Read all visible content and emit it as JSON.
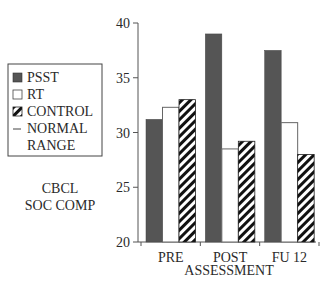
{
  "chart_data": {
    "type": "bar",
    "title": "",
    "ylabel": "CBCL SOC COMP",
    "ylabel_lines": [
      "CBCL",
      "SOC COMP"
    ],
    "xlabel": "ASSESSMENT",
    "categories": [
      "PRE",
      "POST",
      "FU 12"
    ],
    "ylim": [
      20,
      40
    ],
    "yticks": [
      20,
      25,
      30,
      35,
      40
    ],
    "grid": false,
    "legend_position": "left",
    "series": [
      {
        "name": "PSST",
        "style": "solid",
        "color": "#555555",
        "values": [
          31.2,
          39.0,
          37.5
        ]
      },
      {
        "name": "RT",
        "style": "open",
        "color": "#ffffff",
        "values": [
          32.3,
          28.5,
          30.9
        ]
      },
      {
        "name": "CONTROL",
        "style": "hatched",
        "color": "#111111",
        "values": [
          33.0,
          29.2,
          28.0
        ]
      }
    ],
    "legend": [
      {
        "label": "PSST",
        "marker": "solid-square"
      },
      {
        "label": "RT",
        "marker": "open-square"
      },
      {
        "label": "CONTROL",
        "marker": "hatched-square"
      },
      {
        "label": "NORMAL",
        "marker": "dash"
      },
      {
        "label": "RANGE",
        "marker": "none"
      }
    ]
  }
}
